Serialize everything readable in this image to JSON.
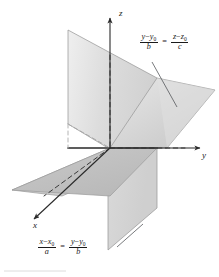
{
  "figure": {
    "background_color": "#ffffff",
    "stroke_color": "#8c8c8c",
    "dark_stroke_color": "#4d4d4d",
    "text_color": "#1a1a1a",
    "plane_fill_light": "#e8e8e8",
    "plane_fill_mid": "#d2d2d2",
    "plane_fill_dark": "#bdbdbd"
  },
  "axes": {
    "z": {
      "label": "z"
    },
    "y": {
      "label": "y"
    },
    "x": {
      "label": "x"
    }
  },
  "equations": {
    "plane_yz": {
      "left_numerator_var": "y",
      "left_numerator_sub": "y",
      "left_numerator_sub_index": "0",
      "left_denominator": "b",
      "right_numerator_var": "z",
      "right_numerator_sub": "z",
      "right_numerator_sub_index": "0",
      "right_denominator": "c",
      "plain": "(y - y0)/b = (z - z0)/c"
    },
    "plane_xy": {
      "left_numerator_var": "x",
      "left_numerator_sub": "x",
      "left_numerator_sub_index": "0",
      "left_denominator": "a",
      "right_numerator_var": "y",
      "right_numerator_sub": "y",
      "right_numerator_sub_index": "0",
      "right_denominator": "b",
      "plain": "(x - x0)/a = (y - y0)/b"
    },
    "minus_sign": "−",
    "equals_sign": "="
  }
}
